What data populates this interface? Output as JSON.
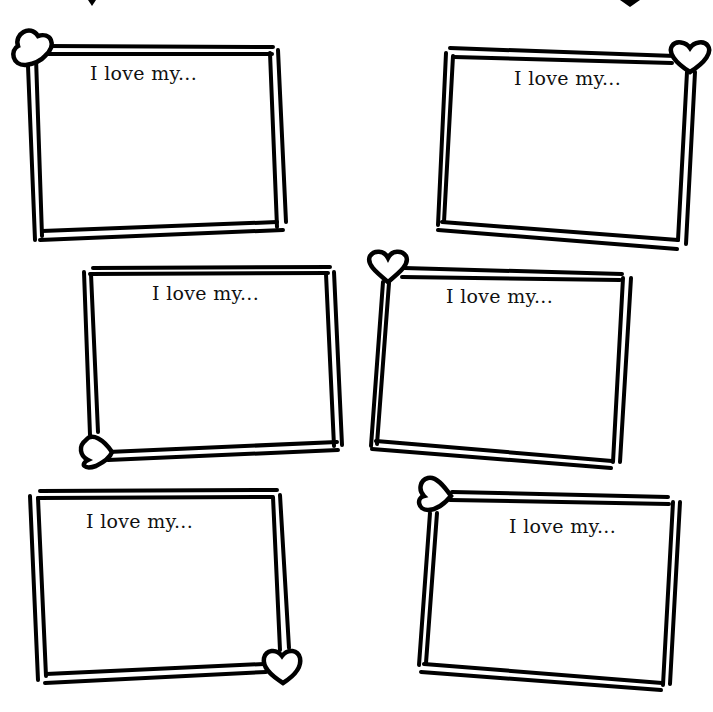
{
  "page": {
    "background": "#ffffff",
    "line_color": "#000000",
    "text_color": "#111111"
  },
  "cards": [
    {
      "prompt": "I love my...",
      "heart_corner": "top-left",
      "text_pos": [
        90,
        62
      ]
    },
    {
      "prompt": "I love my...",
      "heart_corner": "top-right",
      "text_pos": [
        514,
        67
      ]
    },
    {
      "prompt": "I love my...",
      "heart_corner": "bottom-left",
      "text_pos": [
        152,
        282
      ]
    },
    {
      "prompt": "I love my...",
      "heart_corner": "top-left",
      "text_pos": [
        446,
        285
      ]
    },
    {
      "prompt": "I love my...",
      "heart_corner": "bottom-right",
      "text_pos": [
        86,
        510
      ]
    },
    {
      "prompt": "I love my...",
      "heart_corner": "top-left",
      "text_pos": [
        509,
        515
      ]
    }
  ]
}
